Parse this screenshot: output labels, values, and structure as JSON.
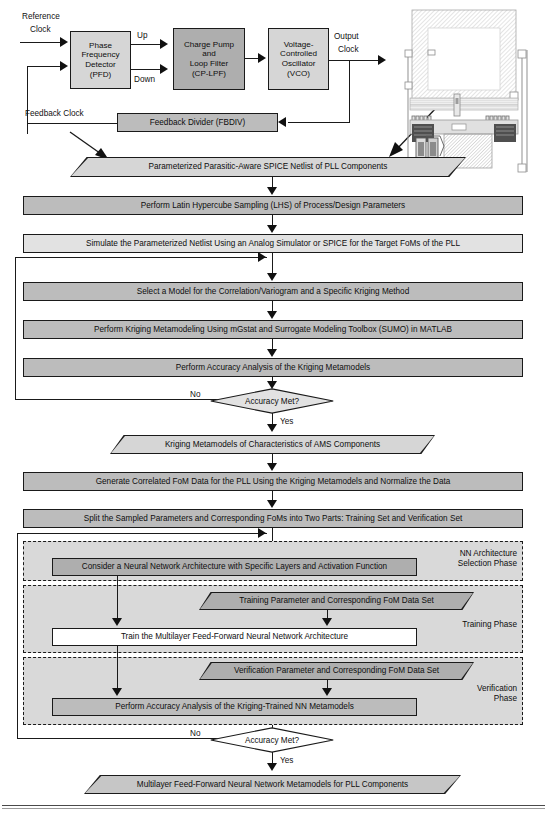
{
  "pll_block_diagram": {
    "labels": {
      "reference_clock_line1": "Reference",
      "reference_clock_line2": "Clock",
      "up": "Up",
      "down": "Down",
      "output_clock_line1": "Output",
      "output_clock_line2": "Clock",
      "feedback_clock": "Feedback Clock"
    },
    "blocks": [
      {
        "name": "pfd",
        "text": "Phase\nFrequency\nDetector\n(PFD)",
        "fill": "#d6d6d6"
      },
      {
        "name": "cplpf",
        "text": "Charge Pump\nand\nLoop Filter\n(CP-LPF)",
        "fill": "#aeaeae"
      },
      {
        "name": "vco",
        "text": "Voltage-\nControlled\nOscillator\n(VCO)",
        "fill": "#d6d6d6"
      },
      {
        "name": "fbdiv",
        "text": "Feedback Divider (FBDIV)",
        "fill": "#bcbcbc"
      }
    ]
  },
  "flow": {
    "netlist_data": "Parameterized Parasitic-Aware SPICE Netlist of PLL Components",
    "lhs_step": "Perform Latin Hypercube Sampling (LHS) of Process/Design Parameters",
    "simulate_step": "Simulate the Parameterized Netlist Using an Analog Simulator or SPICE for the Target FoMs of the PLL",
    "select_model_step": "Select a Model for the Correlation/Variogram and a Specific Kriging Method",
    "kriging_metamodeling_step": "Perform Kriging Metamodeling Using mGstat and Surrogate Modeling Toolbox (SUMO) in MATLAB",
    "kriging_accuracy_step": "Perform Accuracy Analysis of the Kriging Metamodels",
    "decision_1": "Accuracy Met?",
    "decision_1_no": "No",
    "decision_1_yes": "Yes",
    "kriging_metamodels_data": "Kriging Metamodels of Characteristics of AMS Components",
    "generate_fom_step": "Generate Correlated FoM Data for the PLL Using the Kriging Metamodels and Normalize the Data",
    "split_step": "Split the Sampled Parameters and Corresponding FoMs into Two Parts: Training Set and Verification Set",
    "consider_nn_step": "Consider a Neural Network Architecture with Specific Layers and Activation Function",
    "training_data": "Training Parameter and Corresponding FoM Data Set",
    "train_step": "Train the Multilayer Feed-Forward Neural Network Architecture",
    "verification_data": "Verification Parameter and Corresponding FoM Data Set",
    "verify_accuracy_step": "Perform Accuracy Analysis of the Kriging-Trained NN Metamodels",
    "decision_2": "Accuracy Met?",
    "decision_2_no": "No",
    "decision_2_yes": "Yes",
    "final_data": "Multilayer Feed-Forward Neural Network Metamodels for PLL Components"
  },
  "phases": {
    "nn_architecture_line1": "NN Architecture",
    "nn_architecture_line2": "Selection Phase",
    "training": "Training Phase",
    "verification_line1": "Verification",
    "verification_line2": "Phase"
  },
  "colors": {
    "fill_dark": "#aeaeae",
    "fill_mid": "#bcbcbc",
    "fill_light": "#d6d6d6",
    "fill_lighter": "#e2e2e2",
    "phase_bg": "#d9d9d9",
    "stroke": "#1a1a1a",
    "background": "#ffffff"
  },
  "icons": {
    "chip_layout": "ic-layout-thumbnail"
  }
}
